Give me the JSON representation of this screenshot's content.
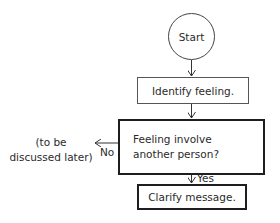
{
  "flowchart": {
    "nodes": {
      "start": {
        "label": "Start",
        "shape": "circle"
      },
      "identify": {
        "label": "Identify feeling.",
        "shape": "process"
      },
      "decision": {
        "label": "Feeling involve another person?",
        "shape": "decision-box"
      },
      "clarify": {
        "label": "Clarify message.",
        "shape": "process"
      }
    },
    "edges": [
      {
        "from": "start",
        "to": "identify",
        "label": ""
      },
      {
        "from": "identify",
        "to": "decision",
        "label": ""
      },
      {
        "from": "decision",
        "to": "clarify",
        "label": "Yes"
      },
      {
        "from": "decision",
        "to": "side_note",
        "label": "No"
      }
    ],
    "side_note": {
      "line1": "(to be",
      "line2": "discussed later)"
    },
    "edge_labels": {
      "yes": "Yes",
      "no": "No"
    }
  }
}
